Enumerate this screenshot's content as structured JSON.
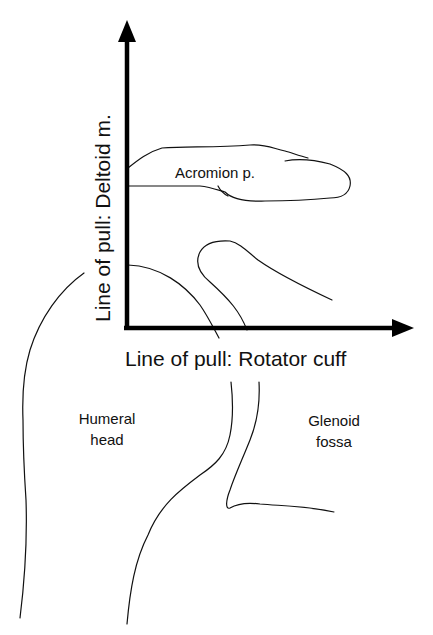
{
  "diagram": {
    "axes": {
      "vertical": {
        "label": "Line of pull: Deltoid m."
      },
      "horizontal": {
        "label": "Line of pull: Rotator cuff"
      }
    },
    "regions": {
      "acromion": {
        "label": "Acromion p."
      },
      "humeral_head": {
        "line1": "Humeral",
        "line2": "head"
      },
      "glenoid_fossa": {
        "line1": "Glenoid",
        "line2": "fossa"
      }
    },
    "colors": {
      "ink": "#111111",
      "background": "#ffffff"
    }
  }
}
